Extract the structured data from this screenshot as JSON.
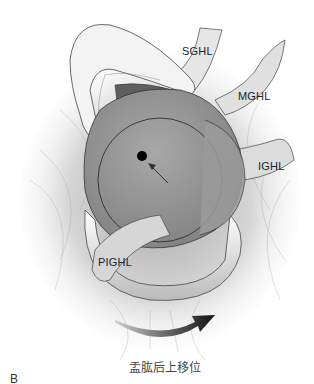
{
  "figure": {
    "panel_letter": "B",
    "caption": "盂肱后上移位",
    "labels": {
      "sghl": "SGHL",
      "mghl": "MGHL",
      "ighl": "IGHL",
      "pighl": "PIGHL"
    },
    "colors": {
      "background": "#ffffff",
      "ligament_light": "#f2f2f2",
      "fiber_gray": "#bdbdbd",
      "humeral_head": "#9a9a9a",
      "outline": "#333333",
      "center_dot": "#000000",
      "arrow_dark": "#1a1a1a"
    }
  }
}
